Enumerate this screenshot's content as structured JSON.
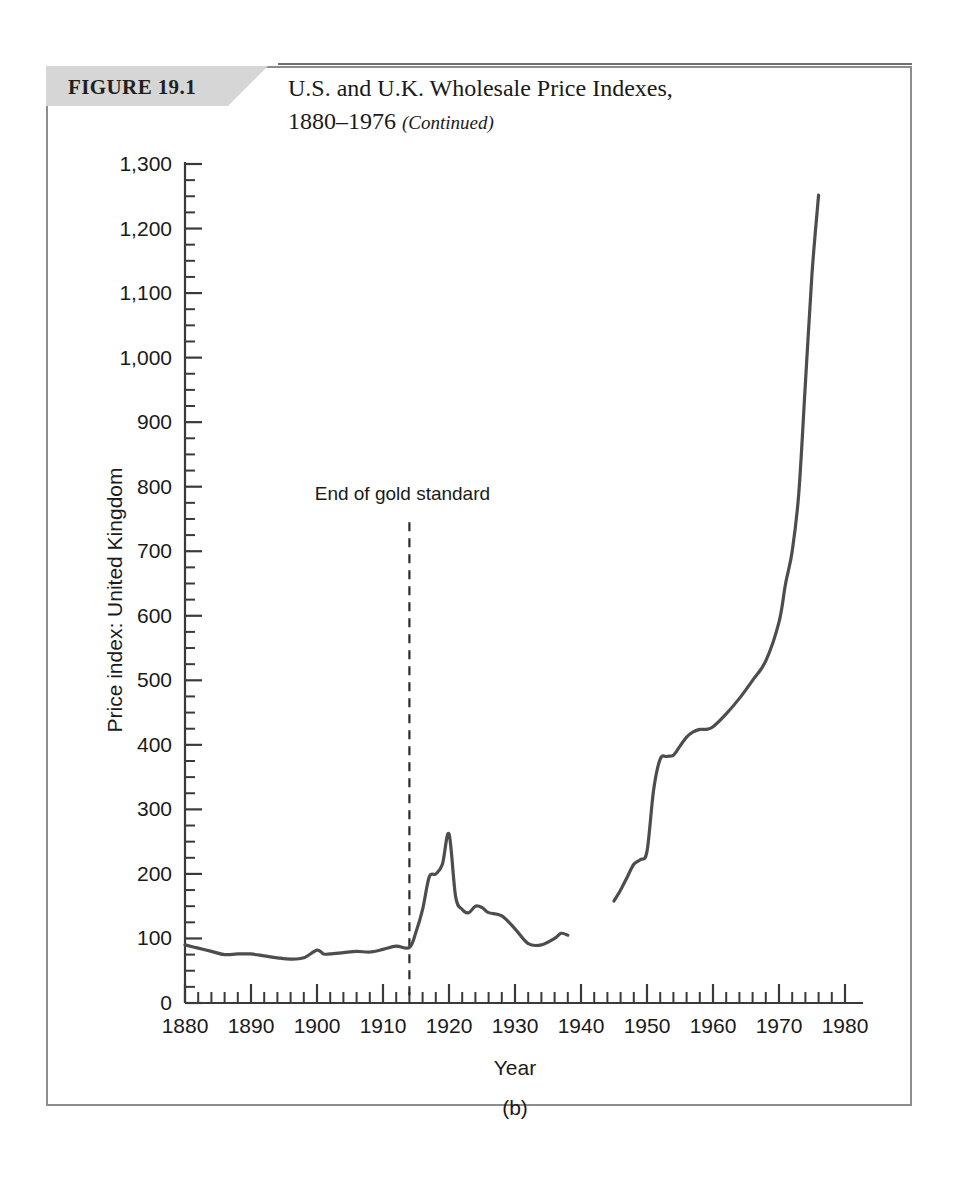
{
  "figure": {
    "tag": "FIGURE 19.1",
    "title_line1": "U.S. and U.K. Wholesale Price Indexes,",
    "title_line2_main": "1880–1976 ",
    "title_line2_note": "(Continued)",
    "subcaption": "(b)"
  },
  "colors": {
    "tag_background": "#d6d6d6",
    "frame_border": "#8d8d8d",
    "series": "#4d4d4d",
    "axis": "#3a3a3a",
    "text": "#1a1a1a",
    "page_background": "#ffffff"
  },
  "chart_data": {
    "type": "line",
    "title": "U.S. and U.K. Wholesale Price Indexes, 1880–1976 (Continued)",
    "xlabel": "Year",
    "ylabel": "Price index: United Kingdom",
    "xlim": [
      1880,
      1980
    ],
    "ylim": [
      0,
      1300
    ],
    "grid": false,
    "legend": "none",
    "x_tick_labels": [
      "1880",
      "1890",
      "1900",
      "1910",
      "1920",
      "1930",
      "1940",
      "1950",
      "1960",
      "1970",
      "1980"
    ],
    "x_tick_values": [
      1880,
      1890,
      1900,
      1910,
      1920,
      1930,
      1940,
      1950,
      1960,
      1970,
      1980
    ],
    "x_minor_step": 2,
    "y_tick_labels": [
      "0",
      "100",
      "200",
      "300",
      "400",
      "500",
      "600",
      "700",
      "800",
      "900",
      "1,000",
      "1,100",
      "1,200",
      "1,300"
    ],
    "y_tick_values": [
      0,
      100,
      200,
      300,
      400,
      500,
      600,
      700,
      800,
      900,
      1000,
      1100,
      1200,
      1300
    ],
    "y_minor_step": 25,
    "annotations": [
      {
        "text": "End of gold standard",
        "x": 1914,
        "label_y": 780,
        "line_from_y": 745,
        "line_to_y": 0,
        "style": "dashed-vertical"
      }
    ],
    "series": [
      {
        "name": "Price index: United Kingdom",
        "segments": [
          {
            "name": "pre-war-and-interwar",
            "x": [
              1880,
              1882,
              1884,
              1886,
              1888,
              1890,
              1892,
              1894,
              1896,
              1898,
              1900,
              1901,
              1902,
              1904,
              1906,
              1908,
              1910,
              1912,
              1914,
              1915,
              1916,
              1917,
              1918,
              1919,
              1920,
              1921,
              1922,
              1923,
              1924,
              1925,
              1926,
              1928,
              1930,
              1932,
              1934,
              1936,
              1937,
              1938
            ],
            "y": [
              90,
              85,
              80,
              75,
              76,
              76,
              73,
              70,
              68,
              70,
              82,
              76,
              76,
              78,
              80,
              79,
              83,
              88,
              86,
              110,
              145,
              195,
              200,
              215,
              262,
              165,
              145,
              140,
              150,
              148,
              140,
              135,
              115,
              92,
              90,
              100,
              108,
              105
            ]
          },
          {
            "name": "post-war",
            "x": [
              1945,
              1946,
              1947,
              1948,
              1949,
              1950,
              1951,
              1952,
              1953,
              1954,
              1955,
              1956,
              1957,
              1958,
              1959,
              1960,
              1962,
              1964,
              1966,
              1968,
              1970,
              1971,
              1972,
              1973,
              1974,
              1975,
              1976
            ],
            "y": [
              158,
              175,
              195,
              215,
              222,
              235,
              330,
              378,
              382,
              384,
              398,
              412,
              420,
              424,
              424,
              428,
              448,
              472,
              500,
              530,
              590,
              650,
              700,
              790,
              960,
              1130,
              1252
            ]
          }
        ]
      }
    ]
  }
}
